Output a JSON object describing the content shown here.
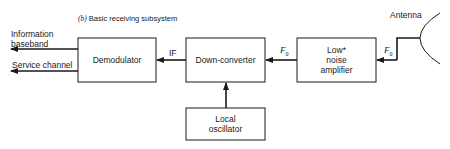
{
  "diagram": {
    "title_prefix": "(b)",
    "title": "Basic receiving subsystem",
    "blocks": {
      "demodulator": "Demodulator",
      "down_converter": "Down-converter",
      "lna_line1": "Low*",
      "lna_line2": "noise",
      "lna_line3": "amplifier",
      "local_osc_line1": "Local",
      "local_osc_line2": "oscillator"
    },
    "outputs": {
      "info_line1": "Information",
      "info_line2": "baseband",
      "service": "Service channel"
    },
    "signals": {
      "if": "IF",
      "f0_symbol": "F",
      "f0_sub": "0"
    },
    "antenna_label": "Antenna",
    "colors": {
      "line": "#1a1a1a",
      "background": "#ffffff"
    }
  }
}
